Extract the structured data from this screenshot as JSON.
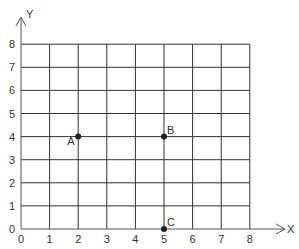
{
  "chart_data": {
    "type": "scatter",
    "title": "",
    "xlabel": "X",
    "ylabel": "Y",
    "xlim": [
      0,
      8
    ],
    "ylim": [
      0,
      8
    ],
    "grid": true,
    "x_ticks": [
      "0",
      "1",
      "2",
      "3",
      "4",
      "5",
      "6",
      "7",
      "8"
    ],
    "y_ticks": [
      "0",
      "1",
      "2",
      "3",
      "4",
      "5",
      "6",
      "7",
      "8"
    ],
    "points": [
      {
        "label": "A",
        "x": 2,
        "y": 4,
        "label_pos": "left-below"
      },
      {
        "label": "B",
        "x": 5,
        "y": 4,
        "label_pos": "right-above"
      },
      {
        "label": "C",
        "x": 5,
        "y": 0,
        "label_pos": "right-above"
      }
    ]
  },
  "colors": {
    "grid": "#333333",
    "point": "#222222",
    "text": "#333333"
  }
}
